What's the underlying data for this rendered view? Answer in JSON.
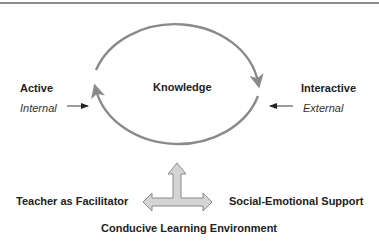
{
  "diagram": {
    "center_label": "Knowledge",
    "left": {
      "title": "Active",
      "subtitle": "Internal"
    },
    "right": {
      "title": "Interactive",
      "subtitle": "External"
    },
    "bottom_left": "Teacher as Facilitator",
    "bottom_right": "Social-Emotional Support",
    "bottom_center": "Conducive Learning Environment",
    "icons": {
      "cycle": "circular-cycle-arrows-icon",
      "internal_arrow": "arrow-right-icon",
      "external_arrow": "arrow-left-icon",
      "three_way": "three-way-arrow-icon"
    },
    "colors": {
      "cycle_stroke": "#8a8a8a",
      "three_way_fill": "#d4d4d4",
      "three_way_stroke": "#8a8a8a",
      "text": "#222222",
      "rule": "#8c8c8c"
    }
  }
}
